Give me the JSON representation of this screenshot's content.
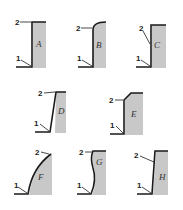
{
  "diagram": {
    "colors": {
      "line": "#1a1a1a",
      "fill": "#c8c8c8",
      "background": "#ffffff"
    },
    "marker_labels": {
      "bottom": "1",
      "top": "2"
    },
    "panels": [
      {
        "id": "A",
        "label": "A",
        "shape": "straight vertical wall, sharp top corner"
      },
      {
        "id": "B",
        "label": "B",
        "shape": "vertical wall with rounded top corner"
      },
      {
        "id": "C",
        "label": "C",
        "shape": "vertical wall, sharp top, point 2 mid-wall"
      },
      {
        "id": "D",
        "label": "D",
        "shape": "slightly inclined wall"
      },
      {
        "id": "E",
        "label": "E",
        "shape": "vertical wall with chamfered top"
      },
      {
        "id": "F",
        "label": "F",
        "shape": "convex curved wall"
      },
      {
        "id": "G",
        "label": "G",
        "shape": "S-shaped curved wall"
      },
      {
        "id": "H",
        "label": "H",
        "shape": "nearly vertical slightly inclined wall"
      }
    ]
  }
}
